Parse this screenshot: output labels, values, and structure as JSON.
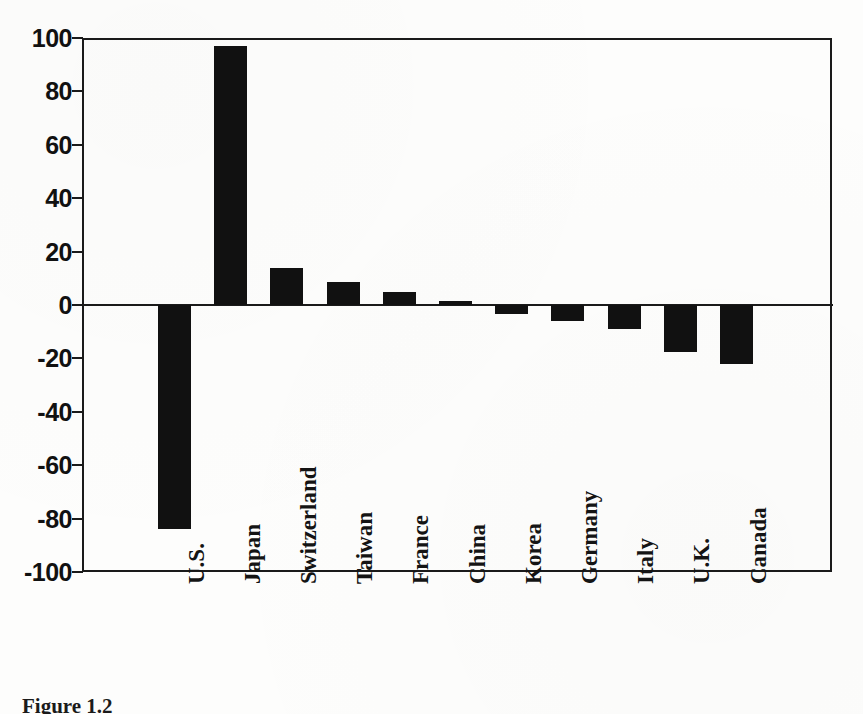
{
  "figure": {
    "caption": "Figure 1.2",
    "bar_color": "#111111",
    "axis_color": "#1a1a1a",
    "background_color": "#fdfdfc"
  },
  "chart_data": {
    "type": "bar",
    "title": "",
    "subtitle": "",
    "xlabel": "",
    "ylabel": "",
    "ylim": [
      -100,
      100
    ],
    "yticks": [
      100,
      80,
      60,
      40,
      20,
      0,
      -20,
      -40,
      -60,
      -80,
      -100
    ],
    "ytick_labels": [
      "100",
      "80",
      "60",
      "40",
      "20",
      "0",
      "-20",
      "-40",
      "-60",
      "-80",
      "-100"
    ],
    "grid": false,
    "legend": null,
    "zero_line": 0,
    "categories": [
      "U.S.",
      "Japan",
      "Switzerland",
      "Taiwan",
      "France",
      "China",
      "Korea",
      "Germany",
      "Italy",
      "U.K.",
      "Canada"
    ],
    "values": [
      -84,
      97,
      14,
      8.5,
      5,
      1.5,
      -3.5,
      -6,
      -9,
      -17.5,
      -22
    ],
    "series": [
      {
        "name": "",
        "values": [
          -84,
          97,
          14,
          8.5,
          5,
          1.5,
          -3.5,
          -6,
          -9,
          -17.5,
          -22
        ]
      }
    ]
  }
}
